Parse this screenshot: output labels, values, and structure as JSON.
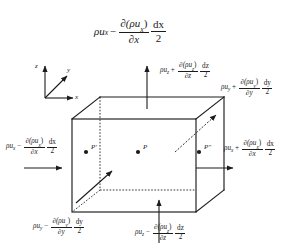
{
  "figure": {
    "background_color": "#ffffff",
    "line_color": "#1c1c1c",
    "text_color": "#1c1c1c"
  },
  "axes": {
    "z_label": "z",
    "y_label": "y",
    "x_label": "x"
  },
  "points": [
    {
      "name": "point-p-prime",
      "label": "P'"
    },
    {
      "name": "point-p",
      "label": "P"
    },
    {
      "name": "point-p-double-prime",
      "label": "P″"
    }
  ],
  "equations": {
    "top_center": {
      "id": "x-inflow-top",
      "rho": "ρ",
      "u": "u",
      "u_sub": "x",
      "operator": "−",
      "num": "∂(ρu",
      "num_sub": "x",
      "num_close": ")",
      "den": "∂x",
      "frac2_num": "dx",
      "frac2_den": "2",
      "plain": "ρuₓ − ∂(ρuₓ)/∂x · dx/2"
    },
    "top_right": {
      "id": "z-outflow",
      "rho": "ρ",
      "u": "u",
      "u_sub": "z",
      "operator": "+",
      "num": "∂(ρu",
      "num_sub": "z",
      "num_close": ")",
      "den": "∂z",
      "frac2_num": "dz",
      "frac2_den": "2",
      "plain": "ρu_z + ∂(ρu_z)/∂z · dz/2"
    },
    "right_upper": {
      "id": "y-outflow",
      "rho": "ρ",
      "u": "u",
      "u_sub": "y",
      "operator": "+",
      "num": "∂(ρu",
      "num_sub": "y",
      "num_close": ")",
      "den": "∂y",
      "frac2_num": "dy",
      "frac2_den": "2",
      "plain": "ρu_y + ∂(ρu_y)/∂y · dy/2"
    },
    "right_middle": {
      "id": "x-outflow",
      "rho": "ρ",
      "u": "u",
      "u_sub": "x",
      "operator": "+",
      "num": "∂(ρu",
      "num_sub": "x",
      "num_close": ")",
      "den": "∂x",
      "frac2_num": "dx",
      "frac2_den": "2",
      "plain": "ρu_x + ∂(ρu_x)/∂x · dx/2"
    },
    "left_middle": {
      "id": "x-inflow",
      "rho": "ρ",
      "u": "u",
      "u_sub": "x",
      "operator": "−",
      "num": "∂(ρu",
      "num_sub": "x",
      "num_close": ")",
      "den": "∂x",
      "frac2_num": "dx",
      "frac2_den": "2",
      "plain": "ρu_x − ∂(ρu_x)/∂x · dx/2"
    },
    "bottom_left": {
      "id": "y-inflow",
      "rho": "ρ",
      "u": "u",
      "u_sub": "y",
      "operator": "−",
      "num": "∂(ρu",
      "num_sub": "y",
      "num_close": ")",
      "den": "∂y",
      "frac2_num": "dy",
      "frac2_den": "2",
      "plain": "ρu_y − ∂(ρu_y)/∂y · dy/2"
    },
    "bottom_right": {
      "id": "z-inflow",
      "rho": "ρ",
      "u": "u",
      "u_sub": "z",
      "operator": "−",
      "num": "∂(ρu",
      "num_sub": "z",
      "num_close": ")",
      "den": "∂z",
      "frac2_num": "dz",
      "frac2_den": "2",
      "plain": "ρu_z − ∂(ρu_z)/∂z · dz/2"
    }
  }
}
